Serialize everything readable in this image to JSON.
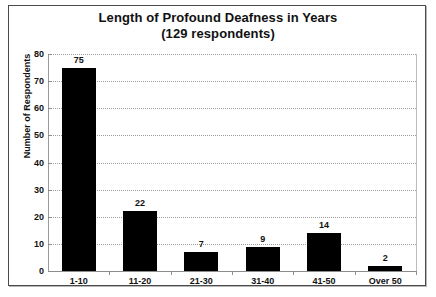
{
  "chart_data": {
    "type": "bar",
    "title": "Length of Profound Deafness in Years",
    "subtitle": "(129 respondents)",
    "categories": [
      "1-10",
      "11-20",
      "21-30",
      "31-40",
      "41-50",
      "Over 50"
    ],
    "values": [
      75,
      22,
      7,
      9,
      14,
      2
    ],
    "xlabel": "",
    "ylabel": "Number of Respondents",
    "ylim": [
      0,
      80
    ],
    "ytick_labels": [
      "0",
      "10",
      "20",
      "30",
      "40",
      "50",
      "60",
      "70",
      "80"
    ],
    "ytick_values": [
      0,
      10,
      20,
      30,
      40,
      50,
      60,
      70,
      80
    ],
    "grid": true,
    "legend": false,
    "bar_color": "#000000",
    "gridline_color": "#9a9a9a",
    "axis_color": "#8c8c8c",
    "background_color": "#ffffff"
  }
}
